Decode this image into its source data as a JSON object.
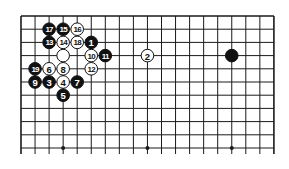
{
  "diagram": {
    "type": "go-board-fragment",
    "grid": {
      "columns": 19,
      "rows_visible": 11,
      "left": 21,
      "top": 16,
      "col_spacing": 14.05,
      "row_spacing": 13.2,
      "bottom_edge_open": true,
      "line_color": "#1a1a1a"
    },
    "star_points": [
      {
        "col": 3,
        "row": 10
      },
      {
        "col": 9,
        "row": 10
      },
      {
        "col": 15,
        "row": 10
      }
    ],
    "stones": [
      {
        "color": "black",
        "label": "1",
        "col": 5,
        "row": 2
      },
      {
        "color": "white",
        "label": "2",
        "col": 9,
        "row": 3
      },
      {
        "color": "black",
        "label": "3",
        "col": 2,
        "row": 5
      },
      {
        "color": "white",
        "label": "4",
        "col": 3,
        "row": 5
      },
      {
        "color": "black",
        "label": "5",
        "col": 3,
        "row": 6
      },
      {
        "color": "white",
        "label": "6",
        "col": 2,
        "row": 4
      },
      {
        "color": "black",
        "label": "7",
        "col": 4,
        "row": 5
      },
      {
        "color": "white",
        "label": "8",
        "col": 3,
        "row": 4
      },
      {
        "color": "black",
        "label": "9",
        "col": 1,
        "row": 5
      },
      {
        "color": "white",
        "label": "10",
        "col": 5,
        "row": 3
      },
      {
        "color": "black",
        "label": "11",
        "col": 6,
        "row": 3
      },
      {
        "color": "white",
        "label": "12",
        "col": 5,
        "row": 4
      },
      {
        "color": "black",
        "label": "13",
        "col": 2,
        "row": 2
      },
      {
        "color": "white",
        "label": "14",
        "col": 3,
        "row": 2
      },
      {
        "color": "black",
        "label": "15",
        "col": 3,
        "row": 1
      },
      {
        "color": "white",
        "label": "16",
        "col": 4,
        "row": 1
      },
      {
        "color": "black",
        "label": "17",
        "col": 2,
        "row": 1
      },
      {
        "color": "white",
        "label": "18",
        "col": 4,
        "row": 2
      },
      {
        "color": "black",
        "label": "19",
        "col": 1,
        "row": 4
      },
      {
        "color": "white",
        "label": "",
        "col": 3,
        "row": 3
      },
      {
        "color": "black",
        "label": "",
        "col": 15,
        "row": 3
      }
    ],
    "colors": {
      "black_stone": "#111111",
      "white_stone": "#ffffff",
      "stone_outline": "#111111",
      "background": "#ffffff"
    }
  }
}
